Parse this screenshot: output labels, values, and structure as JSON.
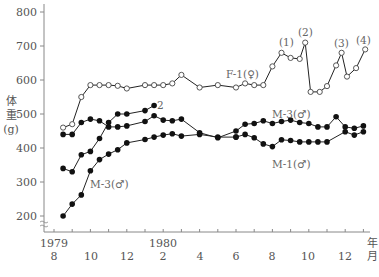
{
  "chart_data": {
    "type": "line",
    "title": "",
    "xlabel": "年 月",
    "ylabel": "体重 (g)",
    "ylim": [
      190,
      820
    ],
    "y_ticks": [
      200,
      300,
      400,
      500,
      600,
      700,
      800
    ],
    "x_tick_labels": [
      {
        "month": "8",
        "year": "1979",
        "pos": 0
      },
      {
        "month": "10",
        "pos": 2
      },
      {
        "month": "12",
        "pos": 4
      },
      {
        "month": "2",
        "year": "1980",
        "pos": 6
      },
      {
        "month": "4",
        "pos": 8
      },
      {
        "month": "6",
        "pos": 10
      },
      {
        "month": "8",
        "pos": 12
      },
      {
        "month": "10",
        "pos": 14
      },
      {
        "month": "12",
        "pos": 16
      }
    ],
    "x_unit_year": "年",
    "x_unit_month": "月",
    "grid": false,
    "legend_position": "inline",
    "annotations": [
      "(1)",
      "(2)",
      "(3)",
      "(4)"
    ],
    "series": [
      {
        "name": "F-1(♀)",
        "marker": "open-circle",
        "points": [
          [
            0.5,
            460
          ],
          [
            1.0,
            470
          ],
          [
            1.5,
            550
          ],
          [
            2.0,
            585
          ],
          [
            2.5,
            585
          ],
          [
            3.0,
            585
          ],
          [
            3.5,
            583
          ],
          [
            4.0,
            575
          ],
          [
            5.0,
            585
          ],
          [
            5.5,
            585
          ],
          [
            6.0,
            585
          ],
          [
            6.5,
            590
          ],
          [
            7.0,
            615
          ],
          [
            8.0,
            578
          ],
          [
            9.0,
            585
          ],
          [
            10.0,
            578
          ],
          [
            10.5,
            590
          ],
          [
            11.0,
            585
          ],
          [
            11.5,
            585
          ],
          [
            12.0,
            640
          ],
          [
            12.5,
            680
          ],
          [
            13.0,
            665
          ],
          [
            13.5,
            662
          ],
          [
            13.8,
            710
          ],
          [
            14.1,
            565
          ],
          [
            14.6,
            565
          ],
          [
            15.0,
            582
          ],
          [
            15.5,
            643
          ],
          [
            15.8,
            680
          ],
          [
            16.1,
            610
          ],
          [
            16.6,
            635
          ],
          [
            17.1,
            690
          ]
        ]
      },
      {
        "name": "M-2(♂)†",
        "marker": "filled-circle",
        "points": [
          [
            0.5,
            340
          ],
          [
            1.0,
            330
          ],
          [
            1.5,
            380
          ],
          [
            2.0,
            390
          ],
          [
            2.5,
            428
          ],
          [
            3.0,
            475
          ],
          [
            3.5,
            500
          ],
          [
            4.0,
            500
          ],
          [
            5.0,
            510
          ],
          [
            5.5,
            525
          ]
        ]
      },
      {
        "name": "M-3(♂) upper",
        "marker": "filled-circle",
        "points": [
          [
            0.5,
            440
          ],
          [
            1.0,
            440
          ],
          [
            1.5,
            475
          ],
          [
            2.0,
            485
          ],
          [
            2.5,
            480
          ],
          [
            3.0,
            462
          ],
          [
            3.5,
            462
          ],
          [
            4.0,
            465
          ],
          [
            5.0,
            478
          ],
          [
            5.5,
            495
          ],
          [
            6.0,
            482
          ],
          [
            6.5,
            480
          ],
          [
            7.0,
            485
          ],
          [
            8.0,
            445
          ],
          [
            9.0,
            430
          ],
          [
            10.0,
            450
          ],
          [
            10.5,
            470
          ],
          [
            11.0,
            472
          ],
          [
            11.5,
            480
          ],
          [
            12.0,
            472
          ],
          [
            12.5,
            478
          ],
          [
            13.0,
            482
          ],
          [
            13.5,
            475
          ],
          [
            14.0,
            472
          ],
          [
            14.5,
            462
          ],
          [
            15.0,
            462
          ],
          [
            15.5,
            492
          ],
          [
            16.0,
            462
          ],
          [
            16.5,
            458
          ],
          [
            17.0,
            465
          ]
        ]
      },
      {
        "name": "M-1(♂)",
        "marker": "filled-circle",
        "points": [
          [
            10.0,
            432
          ],
          [
            10.5,
            440
          ],
          [
            11.0,
            430
          ],
          [
            11.5,
            412
          ],
          [
            12.0,
            404
          ],
          [
            12.5,
            424
          ],
          [
            13.0,
            422
          ],
          [
            13.5,
            418
          ],
          [
            14.0,
            418
          ],
          [
            14.5,
            418
          ],
          [
            15.0,
            418
          ],
          [
            16.0,
            448
          ],
          [
            16.5,
            438
          ],
          [
            17.0,
            448
          ]
        ]
      },
      {
        "name": "M-3(♂) lower",
        "marker": "filled-circle",
        "points": [
          [
            0.5,
            200
          ],
          [
            1.0,
            235
          ],
          [
            1.5,
            262
          ],
          [
            2.0,
            333
          ],
          [
            2.5,
            366
          ],
          [
            3.0,
            382
          ],
          [
            3.5,
            395
          ],
          [
            4.0,
            415
          ],
          [
            5.0,
            425
          ],
          [
            5.5,
            432
          ],
          [
            6.0,
            438
          ],
          [
            6.5,
            442
          ],
          [
            7.0,
            435
          ],
          [
            8.0,
            440
          ],
          [
            9.0,
            432
          ],
          [
            10.0,
            432
          ]
        ]
      }
    ]
  },
  "labels": {
    "y_title_1": "体",
    "y_title_2": "重",
    "y_title_3": "(g)",
    "f1": "F-1(♀)",
    "m2": "2",
    "m3_upper": "M-3(♂)",
    "m3_lower": "M-3(♂)",
    "m1": "M-1(♂)",
    "ann1": "(1)",
    "ann2": "(2)",
    "ann3": "(3)",
    "ann4": "(4)",
    "year_1979": "1979",
    "year_1980": "1980",
    "x_unit_year": "年",
    "x_unit_month": "月",
    "y200": "200",
    "y300": "300",
    "y400": "400",
    "y500": "500",
    "y600": "600",
    "y700": "700",
    "y800": "800",
    "m8a": "8",
    "m10a": "10",
    "m12a": "12",
    "m4": "4",
    "m6": "6",
    "m8b": "8",
    "m10b": "10",
    "m12b": "12"
  }
}
